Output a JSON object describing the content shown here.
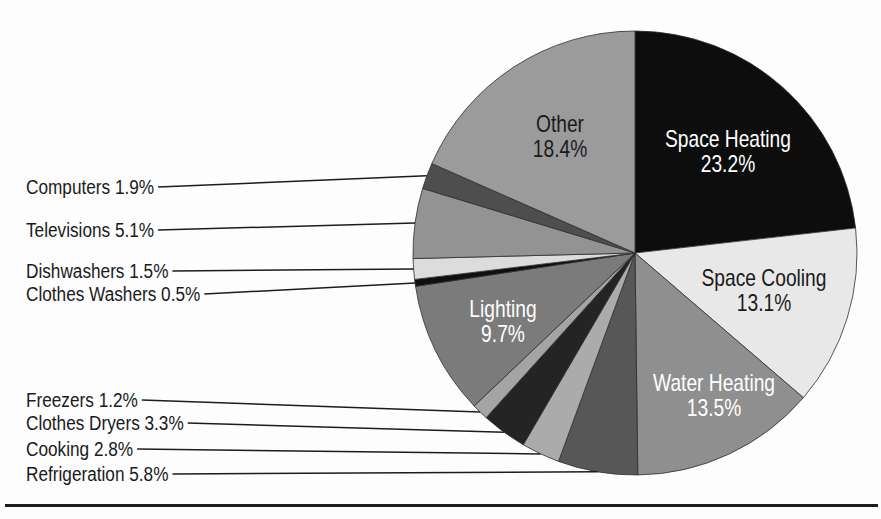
{
  "figure": {
    "background": "#fdfdfd",
    "rule_color": "#1c1c1c",
    "leader_line_color": "#1c1c1c",
    "slice_stroke": "#2e2e2e",
    "callout_text_color": "#1a1a1a"
  },
  "chart_data": {
    "type": "pie",
    "unit": "%",
    "direction": "clockwise",
    "start_angle_deg": 0,
    "legend_position": "none",
    "grid": false,
    "pie": {
      "cx": 635,
      "cy": 253,
      "r": 222
    },
    "categories": [
      "Space Heating",
      "Space Cooling",
      "Water Heating",
      "Refrigeration",
      "Cooking",
      "Clothes Dryers",
      "Freezers",
      "Lighting",
      "Clothes Washers",
      "Dishwashers",
      "Televisions",
      "Computers",
      "Other"
    ],
    "values": [
      23.2,
      13.1,
      13.5,
      5.8,
      2.8,
      3.3,
      1.2,
      9.7,
      0.5,
      1.5,
      5.1,
      1.9,
      18.4
    ],
    "series": [
      {
        "name": "Space Heating",
        "value": 23.2,
        "pct_label": "23.2%",
        "color": "#0d0d0d",
        "label_placement": "inside",
        "label_x": 728,
        "label_y": 152,
        "label_color": "#ffffff"
      },
      {
        "name": "Space Cooling",
        "value": 13.1,
        "pct_label": "13.1%",
        "color": "#e8e8e8",
        "label_placement": "inside",
        "label_x": 764,
        "label_y": 291,
        "label_color": "#1a1a1a"
      },
      {
        "name": "Water Heating",
        "value": 13.5,
        "pct_label": "13.5%",
        "color": "#8f8f8f",
        "label_placement": "inside",
        "label_x": 714,
        "label_y": 396,
        "label_color": "#ffffff"
      },
      {
        "name": "Refrigeration",
        "value": 5.8,
        "display": "Refrigeration 5.8%",
        "color": "#575757",
        "label_placement": "callout",
        "label_x": 26,
        "label_y": 474
      },
      {
        "name": "Cooking",
        "value": 2.8,
        "display": "Cooking 2.8%",
        "color": "#ababab",
        "label_placement": "callout",
        "label_x": 26,
        "label_y": 449
      },
      {
        "name": "Clothes Dryers",
        "value": 3.3,
        "display": "Clothes Dryers 3.3%",
        "color": "#242424",
        "label_placement": "callout",
        "label_x": 26,
        "label_y": 423
      },
      {
        "name": "Freezers",
        "value": 1.2,
        "display": "Freezers 1.2%",
        "color": "#a4a4a4",
        "label_placement": "callout",
        "label_x": 26,
        "label_y": 400
      },
      {
        "name": "Lighting",
        "value": 9.7,
        "pct_label": "9.7%",
        "color": "#7b7b7b",
        "label_placement": "inside",
        "label_x": 503,
        "label_y": 322,
        "label_color": "#ffffff"
      },
      {
        "name": "Clothes Washers",
        "value": 0.5,
        "display": "Clothes Washers 0.5%",
        "color": "#0f0f0f",
        "label_placement": "callout",
        "label_x": 26,
        "label_y": 294
      },
      {
        "name": "Dishwashers",
        "value": 1.5,
        "display": "Dishwashers 1.5%",
        "color": "#dcdcdc",
        "label_placement": "callout",
        "label_x": 26,
        "label_y": 271
      },
      {
        "name": "Televisions",
        "value": 5.1,
        "display": "Televisions 5.1%",
        "color": "#939393",
        "label_placement": "callout",
        "label_x": 26,
        "label_y": 230
      },
      {
        "name": "Computers",
        "value": 1.9,
        "display": "Computers 1.9%",
        "color": "#4e4e4e",
        "label_placement": "callout",
        "label_x": 26,
        "label_y": 187
      },
      {
        "name": "Other",
        "value": 18.4,
        "pct_label": "18.4%",
        "color": "#9b9b9b",
        "label_placement": "inside",
        "label_x": 560,
        "label_y": 137,
        "label_color": "#1a1a1a"
      }
    ]
  }
}
